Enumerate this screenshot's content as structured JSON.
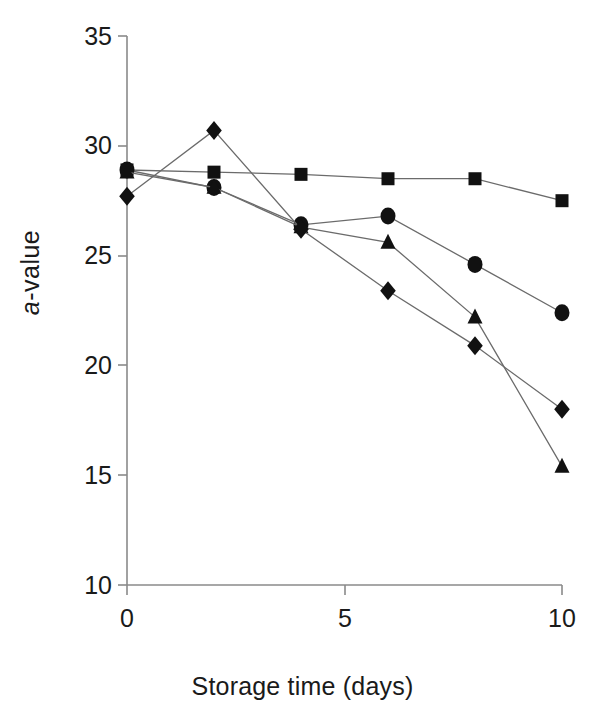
{
  "chart_data": {
    "type": "line",
    "title": "",
    "xlabel": "Storage time (days)",
    "ylabel": "a-value",
    "ylabel_italic_part": "a",
    "ylabel_rest": "-value",
    "x": [
      0,
      2,
      4,
      6,
      8,
      10
    ],
    "xlim": [
      0,
      10
    ],
    "ylim": [
      10,
      35
    ],
    "xticks": [
      0,
      5,
      10
    ],
    "xtick_labels": [
      "0",
      "5",
      "10"
    ],
    "yticks": [
      10,
      15,
      20,
      25,
      30,
      35
    ],
    "ytick_labels": [
      "10",
      "15",
      "20",
      "25",
      "30",
      "35"
    ],
    "grid": false,
    "legend": "none",
    "series": [
      {
        "name": "square-series",
        "marker": "square",
        "color": "#111111",
        "values": [
          28.9,
          28.8,
          28.7,
          28.5,
          28.5,
          27.5
        ]
      },
      {
        "name": "circle-series",
        "marker": "circle",
        "color": "#111111",
        "values": [
          28.9,
          28.1,
          26.4,
          26.8,
          24.6,
          22.4
        ]
      },
      {
        "name": "triangle-series",
        "marker": "triangle",
        "color": "#111111",
        "values": [
          28.8,
          28.1,
          26.3,
          25.6,
          22.2,
          15.4
        ]
      },
      {
        "name": "diamond-series",
        "marker": "diamond",
        "color": "#111111",
        "values": [
          27.7,
          30.7,
          26.2,
          23.4,
          20.9,
          18.0
        ]
      }
    ]
  },
  "axes": {
    "axis_color": "#8a8a8a",
    "line_color": "#6b6b6b",
    "marker_color": "#111111"
  }
}
